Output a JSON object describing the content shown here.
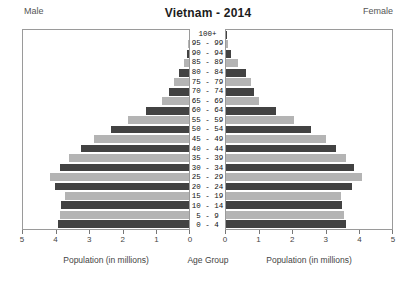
{
  "header": {
    "left_label": "Male",
    "title": "Vietnam - 2014",
    "right_label": "Female"
  },
  "axis": {
    "male_title": "Population (in millions)",
    "center_title": "Age Group",
    "female_title": "Population (in millions)",
    "male_ticks": [
      "5",
      "4",
      "3",
      "2",
      "1",
      "0"
    ],
    "female_ticks": [
      "0",
      "1",
      "2",
      "3",
      "4",
      "5"
    ]
  },
  "colors": {
    "bar_dark": "#424242",
    "bar_light": "#b4b4b4",
    "frame": "#9a9a9a",
    "background": "#ffffff",
    "text": "#333333"
  },
  "chart_data": {
    "type": "bar",
    "subtype": "population-pyramid",
    "title": "Vietnam - 2014",
    "xlabel": "Population (in millions)",
    "ylabel": "Age Group",
    "xlim": [
      0,
      5
    ],
    "grid": false,
    "legend": "none",
    "categories": [
      "0 - 4",
      "5 - 9",
      "10 - 14",
      "15 - 19",
      "20 - 24",
      "25 - 29",
      "30 - 34",
      "35 - 39",
      "40 - 44",
      "45 - 49",
      "50 - 54",
      "55 - 59",
      "60 - 64",
      "65 - 69",
      "70 - 74",
      "75 - 79",
      "80 - 84",
      "85 - 89",
      "90 - 94",
      "95 - 99",
      "100+"
    ],
    "series": [
      {
        "name": "Male",
        "direction": "left",
        "values": [
          3.95,
          3.9,
          3.85,
          3.75,
          4.05,
          4.2,
          3.9,
          3.6,
          3.25,
          2.85,
          2.35,
          1.85,
          1.3,
          0.8,
          0.6,
          0.45,
          0.3,
          0.15,
          0.06,
          0.02,
          0.01
        ]
      },
      {
        "name": "Female",
        "direction": "right",
        "values": [
          3.6,
          3.55,
          3.5,
          3.45,
          3.8,
          4.1,
          3.85,
          3.6,
          3.3,
          3.0,
          2.55,
          2.05,
          1.5,
          1.0,
          0.85,
          0.75,
          0.6,
          0.35,
          0.16,
          0.05,
          0.02
        ]
      }
    ]
  }
}
